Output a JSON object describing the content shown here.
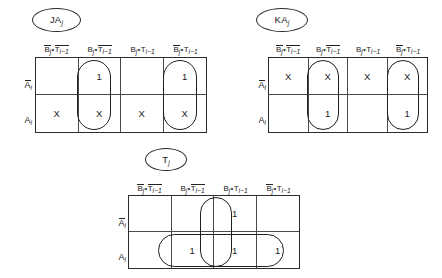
{
  "figure": {
    "column_headers": [
      {
        "b": "B",
        "b_bar": true,
        "t": "T",
        "t_bar": true
      },
      {
        "b": "B",
        "b_bar": false,
        "t": "T",
        "t_bar": true
      },
      {
        "b": "B",
        "b_bar": false,
        "t": "T",
        "t_bar": false
      },
      {
        "b": "B",
        "b_bar": true,
        "t": "T",
        "t_bar": false
      }
    ],
    "header_texts": [
      "B̅j•T̅i-1",
      "Bj•T̅i-1",
      "Bj•Ti-1",
      "B̅j•Ti-1"
    ],
    "symbols": {
      "dot": "•",
      "b_letter": "B",
      "t_letter": "T",
      "a_letter": "A",
      "j_sub": "j",
      "i_sub": "i",
      "i_minus_1_sub": "i−1"
    },
    "row_labels": [
      {
        "text": "A",
        "overbar": true,
        "sub": "i"
      },
      {
        "text": "A",
        "overbar": false,
        "sub": "i"
      }
    ]
  },
  "maps": [
    {
      "id": "JA",
      "title": {
        "text": "JA",
        "sub": "j"
      },
      "rows": [
        {
          "label": "A-bar-i",
          "cells": [
            "",
            "1",
            "",
            "1"
          ]
        },
        {
          "label": "A-i",
          "cells": [
            "X",
            "X",
            "X",
            "X"
          ]
        }
      ],
      "groups": [
        {
          "name": "group-col2",
          "col": 1,
          "row_start": 0,
          "row_span": 2
        },
        {
          "name": "group-col4",
          "col": 3,
          "row_start": 0,
          "row_span": 2
        }
      ]
    },
    {
      "id": "KA",
      "title": {
        "text": "KA",
        "sub": "j"
      },
      "rows": [
        {
          "label": "A-bar-i",
          "cells": [
            "X",
            "X",
            "X",
            "X"
          ]
        },
        {
          "label": "A-i",
          "cells": [
            "",
            "1",
            "",
            "1"
          ]
        }
      ],
      "groups": [
        {
          "name": "group-col2",
          "col": 1,
          "row_start": 0,
          "row_span": 2
        },
        {
          "name": "group-col4",
          "col": 3,
          "row_start": 0,
          "row_span": 2
        }
      ]
    },
    {
      "id": "T",
      "title": {
        "text": "T",
        "sub": "j"
      },
      "rows": [
        {
          "label": "A-bar-i",
          "cells": [
            "",
            "",
            "1",
            ""
          ]
        },
        {
          "label": "A-i",
          "cells": [
            "",
            "1",
            "1",
            "1"
          ]
        }
      ],
      "groups": [
        {
          "name": "group-col3-vertical",
          "col": 2,
          "row_start": 0,
          "row_span": 2
        },
        {
          "name": "group-row2-cols2to4",
          "col": 1,
          "col_span": 3,
          "row_start": 1,
          "row_span": 1
        }
      ]
    }
  ]
}
